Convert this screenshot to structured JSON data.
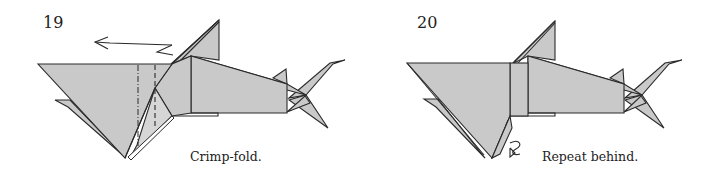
{
  "figures": [
    {
      "step_number": "19",
      "caption": "Crimp-fold.",
      "subject": "origami shark",
      "annotations": [
        "push-arrow-left",
        "mountain-fold-line",
        "valley-fold-line"
      ]
    },
    {
      "step_number": "20",
      "caption": "Repeat behind.",
      "subject": "origami shark",
      "annotations": [
        "repeat-behind-arrow"
      ]
    }
  ],
  "colors": {
    "paper": "#c9c9c9",
    "line": "#2a2a2a",
    "background": "#ffffff"
  }
}
